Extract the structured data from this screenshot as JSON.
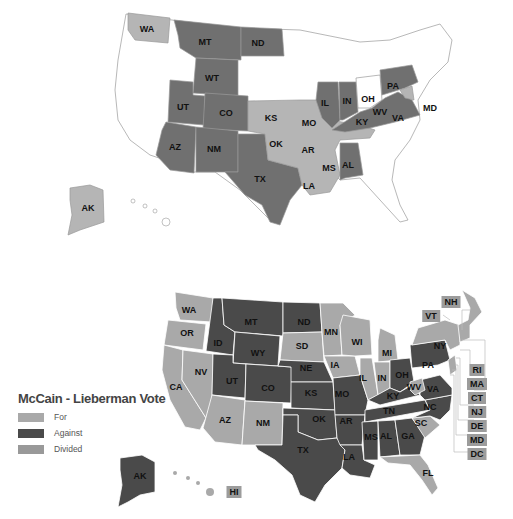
{
  "colors": {
    "top_dark": "#707070",
    "top_light": "#b5b5b5",
    "top_none": "#ffffff",
    "for": "#a9a9a9",
    "against": "#4a4a4a",
    "divided": "#999999"
  },
  "top_map": {
    "labels": {
      "WA": "WA",
      "MT": "MT",
      "ND": "ND",
      "WT": "WT",
      "UT": "UT",
      "CO": "CO",
      "AZ": "AZ",
      "NM": "NM",
      "TX": "TX",
      "KS": "KS",
      "OK": "OK",
      "MO": "MO",
      "AR": "AR",
      "LA": "LA",
      "MS": "MS",
      "AL": "AL",
      "IL": "IL",
      "IN": "IN",
      "OH": "OH",
      "KY": "KY",
      "WV": "WV",
      "VA": "VA",
      "PA": "PA",
      "MD": "MD",
      "AK": "AK"
    }
  },
  "bottom_map": {
    "labels": {
      "WA": "WA",
      "OR": "OR",
      "CA": "CA",
      "ID": "ID",
      "NV": "NV",
      "MT": "MT",
      "WY": "WY",
      "UT": "UT",
      "AZ": "AZ",
      "CO": "CO",
      "NM": "NM",
      "ND": "ND",
      "SD": "SD",
      "NE": "NE",
      "KS": "KS",
      "OK": "OK",
      "TX": "TX",
      "MN": "MN",
      "IA": "IA",
      "MO": "MO",
      "AR": "AR",
      "LA": "LA",
      "WI": "WI",
      "IL": "IL",
      "MI": "MI",
      "IN": "IN",
      "OH": "OH",
      "KY": "KY",
      "TN": "TN",
      "MS": "MS",
      "AL": "AL",
      "GA": "GA",
      "FL": "FL",
      "SC": "SC",
      "NC": "NC",
      "VA": "VA",
      "WV": "WV",
      "PA": "PA",
      "NY": "NY",
      "AK": "AK"
    },
    "boxes": {
      "NH": "NH",
      "VT": "VT",
      "RI": "RI",
      "MA": "MA",
      "CT": "CT",
      "NJ": "NJ",
      "DE": "DE",
      "MD": "MD",
      "DC": "DC",
      "HI": "HI"
    }
  },
  "legend": {
    "title": "McCain - Lieberman Vote",
    "items": [
      {
        "label": "For"
      },
      {
        "label": "Against"
      },
      {
        "label": "Divided"
      }
    ]
  }
}
